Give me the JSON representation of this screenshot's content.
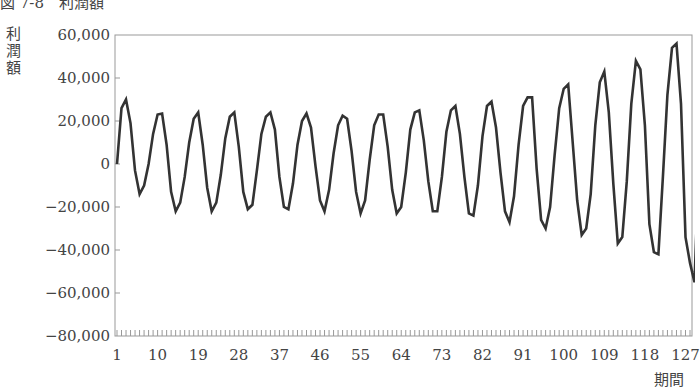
{
  "title": "図 7-8　利潤額",
  "chart_data": {
    "type": "line",
    "xlabel": "期間",
    "ylabel": "利潤額",
    "ylim": [
      -80000,
      60000
    ],
    "yticks": [
      60000,
      40000,
      20000,
      0,
      -20000,
      -40000,
      -60000,
      -80000
    ],
    "ytick_labels": [
      "60,000",
      "40,000",
      "20,000",
      "0",
      "−20,000",
      "−40,000",
      "−60,000",
      "−80,000"
    ],
    "xticks": [
      1,
      10,
      19,
      28,
      37,
      46,
      55,
      64,
      73,
      82,
      91,
      100,
      109,
      118,
      127
    ],
    "xtick_labels": [
      "1",
      "10",
      "19",
      "28",
      "37",
      "46",
      "55",
      "64",
      "73",
      "82",
      "91",
      "100",
      "109",
      "118",
      "127"
    ],
    "xlim": [
      1,
      128
    ],
    "grid": false,
    "legend": null,
    "series": [
      {
        "name": "利潤額",
        "color": "#333333",
        "x_start": 1,
        "values": [
          0,
          26000,
          30000,
          19000,
          -3000,
          -14000,
          -10000,
          0,
          14000,
          23000,
          23500,
          9000,
          -13000,
          -22000,
          -18000,
          -6000,
          10000,
          21000,
          24000,
          9000,
          -11000,
          -22000,
          -18000,
          -5000,
          12000,
          22000,
          24000,
          8000,
          -13000,
          -21000,
          -19000,
          -3000,
          14000,
          22000,
          24000,
          16000,
          -6000,
          -20000,
          -21000,
          -9000,
          9000,
          20000,
          23500,
          17000,
          -1000,
          -17000,
          -22000,
          -12000,
          5000,
          18000,
          22500,
          21000,
          6000,
          -13000,
          -23000,
          -17000,
          2000,
          18000,
          23000,
          23000,
          8000,
          -12000,
          -23000,
          -20000,
          -4000,
          16000,
          24000,
          25000,
          11000,
          -8000,
          -22000,
          -22000,
          -6000,
          15000,
          25000,
          27000,
          14000,
          -6000,
          -23000,
          -24000,
          -10000,
          13000,
          27000,
          29000,
          17000,
          -4000,
          -22000,
          -27000,
          -15000,
          9000,
          27000,
          31000,
          31000,
          -2000,
          -26000,
          -30000,
          -20000,
          4000,
          26000,
          35000,
          37000,
          10000,
          -17000,
          -33000,
          -30000,
          -14000,
          18000,
          38000,
          43000,
          24000,
          -9000,
          -37000,
          -34000,
          -8000,
          28000,
          48000,
          44000,
          18000,
          -28000,
          -41000,
          -42000,
          -6000,
          32000,
          54000,
          56000,
          28000,
          -34000,
          -46000,
          -55000,
          2000
        ]
      }
    ]
  },
  "plot": {
    "left": 115,
    "right": 692,
    "top": 35,
    "bottom": 336,
    "line_color": "#333333",
    "axis_color": "#999999"
  }
}
